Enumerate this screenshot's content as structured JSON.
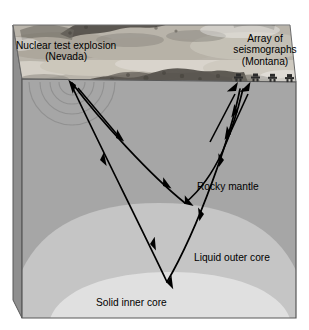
{
  "figure": {
    "type": "cross-section-block-diagram"
  },
  "labels": {
    "explosion_line1": "Nuclear test explosion",
    "explosion_line2": "(Nevada)",
    "array_line1": "Array of",
    "array_line2": "seismographs",
    "array_line3": "(Montana)",
    "mantle": "Rocky mantle",
    "outer_core": "Liquid outer core",
    "inner_core": "Solid inner core"
  },
  "colors": {
    "mantle": "#a8a8a8",
    "outer_core": "#c9c9c9",
    "inner_core": "#e3e3e3",
    "left_face": "#8d8d8d",
    "top_surface_base": "#b5b0a6",
    "outline": "#4a4a4a",
    "ray": "#000000",
    "text": "#000000",
    "background": "#ffffff"
  },
  "geometry": {
    "top_surface": [
      [
        13,
        25
      ],
      [
        290,
        25
      ],
      [
        296,
        82
      ],
      [
        22,
        79
      ]
    ],
    "front_face": [
      [
        22,
        79
      ],
      [
        296,
        82
      ],
      [
        296,
        318
      ],
      [
        22,
        318
      ]
    ],
    "left_face": [
      [
        13,
        25
      ],
      [
        22,
        79
      ],
      [
        22,
        318
      ],
      [
        13,
        300
      ]
    ],
    "mantle_boundary_peak_y": 203,
    "inner_core_peak_y": 272
  },
  "source_point": {
    "x": 72,
    "y": 82
  },
  "wavefront_arcs": {
    "count": 4,
    "radii": [
      13,
      22,
      32,
      43
    ]
  },
  "seismographs": [
    {
      "x": 238,
      "y": 80
    },
    {
      "x": 255,
      "y": 80
    },
    {
      "x": 272,
      "y": 80
    },
    {
      "x": 289,
      "y": 80
    }
  ],
  "ray_paths": [
    {
      "name": "shallow-ray-mantle-turning",
      "description": "Refracted P-wave turning at the core-mantle boundary",
      "down": "M72,83 C100,120 150,175 185,203",
      "up": "M185,203 C218,176 233,130 243,89",
      "arrows_down": [
        [
          116,
          138
        ],
        [
          161,
          185
        ]
      ],
      "arrows_up": [
        [
          225,
          158
        ],
        [
          238,
          110
        ]
      ]
    },
    {
      "name": "deep-ray-inner-core-turning",
      "description": "Refracted P-wave turning at the inner core boundary",
      "down": "M71,84 C92,130 140,225 167,282",
      "up": "M167,282 C199,227 231,135 240,89",
      "arrows_down": [
        [
          100,
          160
        ],
        [
          148,
          240
        ]
      ],
      "arrows_up": [
        [
          203,
          212
        ],
        [
          232,
          132
        ]
      ]
    }
  ],
  "pointer_arrows": [
    {
      "name": "pointer-to-explosion",
      "from": [
        118,
        136
      ],
      "to": [
        76,
        86
      ]
    },
    {
      "name": "pointer-to-array-left",
      "from": [
        212,
        140
      ],
      "to": [
        236,
        92
      ]
    },
    {
      "name": "pointer-to-array-right",
      "from": [
        228,
        140
      ],
      "to": [
        249,
        92
      ]
    }
  ]
}
